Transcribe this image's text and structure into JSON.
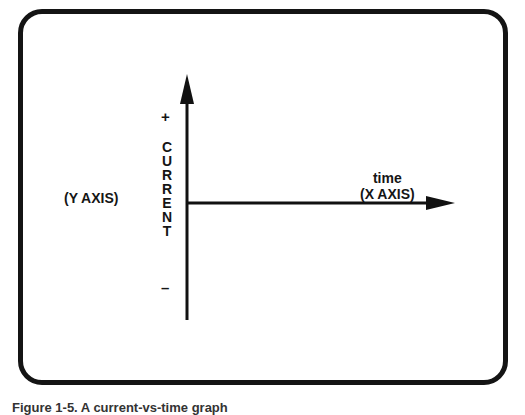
{
  "diagram": {
    "y_axis_label": "(Y AXIS)",
    "y_quantity_letters": [
      "C",
      "U",
      "R",
      "R",
      "E",
      "N",
      "T"
    ],
    "y_plus": "+",
    "y_minus": "–",
    "x_quantity": "time",
    "x_axis_label": "(X AXIS)",
    "caption": "Figure 1-5. A current-vs-time graph"
  }
}
